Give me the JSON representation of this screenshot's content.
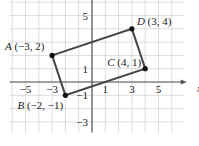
{
  "diagram": {
    "type": "coordinate-plane",
    "axis_labels": {
      "x": "x"
    },
    "x_ticks": [
      {
        "value": -5,
        "label": "−5"
      },
      {
        "value": -3,
        "label": "−3"
      },
      {
        "value": 1,
        "label": "1"
      },
      {
        "value": 3,
        "label": "3"
      },
      {
        "value": 5,
        "label": "5"
      }
    ],
    "y_ticks": [
      {
        "value": 5,
        "label": "5"
      },
      {
        "value": 1,
        "label": "1"
      },
      {
        "value": -1,
        "label": "−1"
      },
      {
        "value": -3,
        "label": "−3"
      }
    ],
    "points": [
      {
        "name": "A",
        "coords": "(−3, 2)",
        "x": -3,
        "y": 2
      },
      {
        "name": "B",
        "coords": "(−2, −1)",
        "x": -2,
        "y": -1
      },
      {
        "name": "C",
        "coords": "(4, 1)",
        "x": 4,
        "y": 1
      },
      {
        "name": "D",
        "coords": "(3, 4)",
        "x": 3,
        "y": 4
      }
    ],
    "polygon": [
      "A",
      "D",
      "C",
      "B"
    ],
    "colors": {
      "grid": "#cfcfcf",
      "axis": "#555555",
      "shape": "#444444",
      "point": "#111111"
    }
  }
}
